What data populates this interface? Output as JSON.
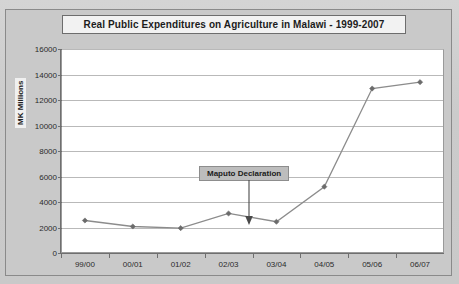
{
  "chart_data": {
    "type": "line",
    "title": "Real Public Expenditures on Agriculture in Malawi - 1999-2007",
    "xlabel": "",
    "ylabel": "MK Millions",
    "categories": [
      "99/00",
      "00/01",
      "01/02",
      "02/03",
      "03/04",
      "04/05",
      "05/06",
      "06/07"
    ],
    "values": [
      2550,
      2080,
      1950,
      3100,
      2450,
      5200,
      12900,
      13400
    ],
    "ylim": [
      0,
      16000
    ],
    "yticks": [
      0,
      2000,
      4000,
      6000,
      8000,
      10000,
      12000,
      14000,
      16000
    ],
    "ytick_labels": [
      "0",
      "2000",
      "4000",
      "6000",
      "8000",
      "10000",
      "12000",
      "14000",
      "16000"
    ],
    "grid": true,
    "legend": false,
    "series_color": "#8c8c8c",
    "marker_color": "#6b6b6b",
    "gridline_color": "#b9b9b9",
    "plot_background": "#ffffff",
    "chart_background": "#c9c9c9",
    "annotations": [
      {
        "text": "Maputo Declaration",
        "points_to_category": "03/04",
        "box_fill": "#bdbdbd",
        "box_border": "#8d8d8d"
      }
    ]
  }
}
